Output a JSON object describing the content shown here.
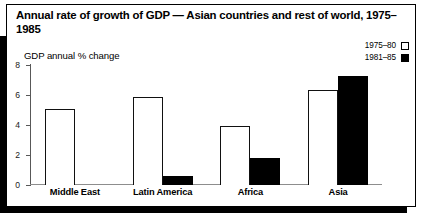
{
  "figure": {
    "title": "Annual rate of growth of GDP — Asian countries and rest of world, 1975–1985",
    "axis_label": "GDP annual % change"
  },
  "legend": {
    "items": [
      {
        "label": "1975–80",
        "style": "open",
        "swatch_name": "legend-swatch-open"
      },
      {
        "label": "1981–85",
        "style": "filled",
        "swatch_name": "legend-swatch-filled"
      }
    ]
  },
  "axis": {
    "ticks": [
      {
        "label": "8",
        "value": 8
      },
      {
        "label": "6",
        "value": 6
      },
      {
        "label": "4",
        "value": 4
      },
      {
        "label": "2",
        "value": 2
      },
      {
        "label": "0",
        "value": 0
      }
    ]
  },
  "chart_data": {
    "type": "bar",
    "title": "Annual rate of growth of GDP — Asian countries and rest of world, 1975–1985",
    "xlabel": "",
    "ylabel": "GDP annual % change",
    "ylim": [
      0,
      8
    ],
    "yticks": [
      0,
      2,
      4,
      6,
      8
    ],
    "grid": false,
    "legend_position": "top-right",
    "categories": [
      "Middle East",
      "Latin America",
      "Africa",
      "Asia"
    ],
    "series": [
      {
        "name": "1975–80",
        "style": "open",
        "values": [
          5.0,
          5.8,
          3.9,
          6.3
        ]
      },
      {
        "name": "1981–85",
        "style": "filled",
        "values": [
          null,
          0.6,
          1.8,
          7.2
        ]
      }
    ]
  }
}
